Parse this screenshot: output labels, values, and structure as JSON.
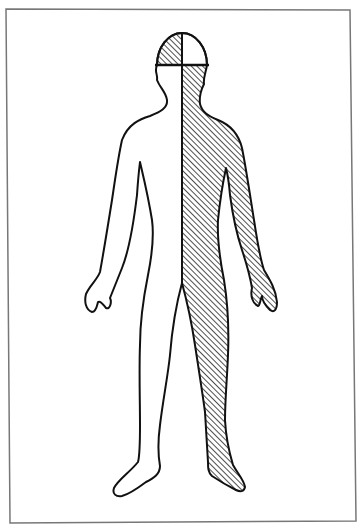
{
  "diagram": {
    "view": "front",
    "frame": {
      "stroke": "#777777"
    },
    "regions": [
      {
        "id": "left-half",
        "label": "left half of body (viewer's left)",
        "fill": "none"
      },
      {
        "id": "right-half",
        "label": "right half of body (viewer's right)",
        "fill": "hatched"
      },
      {
        "id": "head-top-left-quadrant",
        "label": "upper-left head quadrant",
        "fill": "hatched"
      },
      {
        "id": "head-top-right-quadrant",
        "label": "upper-right head quadrant",
        "fill": "none"
      }
    ],
    "colors": {
      "outline": "#111111",
      "hatch": "#222222",
      "background": "#ffffff"
    }
  }
}
